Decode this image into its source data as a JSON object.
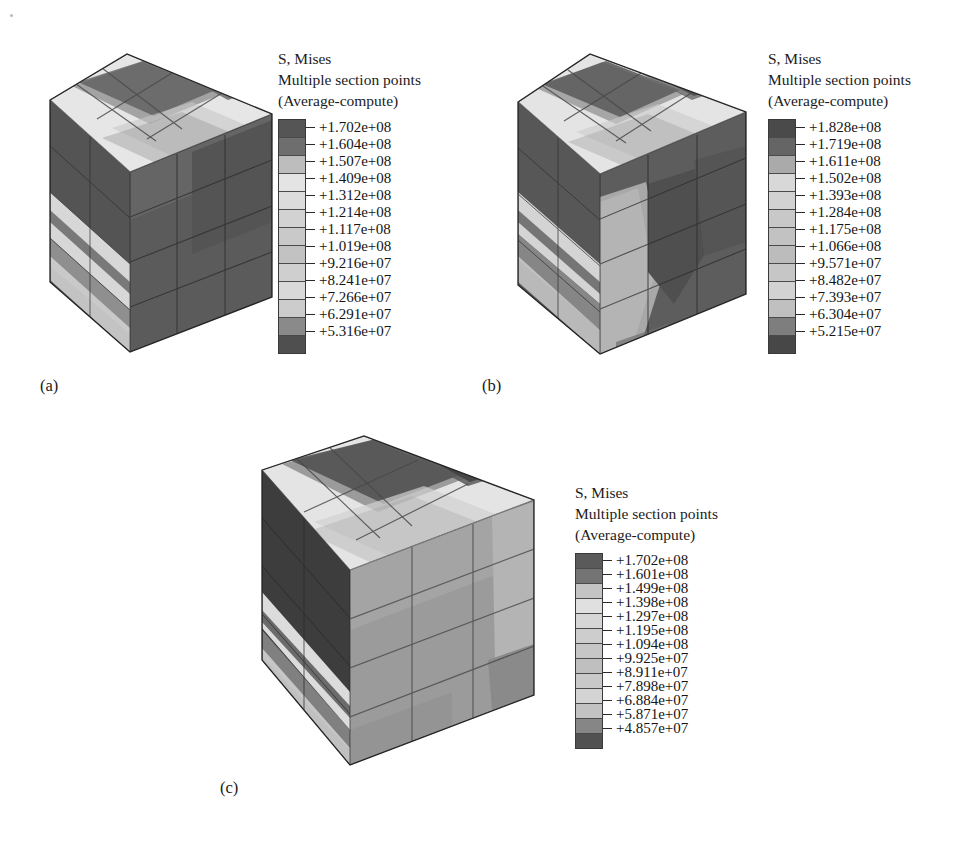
{
  "figure": {
    "background": "#ffffff",
    "panel_count": 3,
    "shared_legend_title_lines": [
      "S, Mises",
      "Multiple section points",
      "(Average-compute)"
    ]
  },
  "panels": [
    {
      "id": "a",
      "label": "(a)",
      "legend": {
        "line1": "S, Mises",
        "line2": "Multiple section points",
        "line3": "(Average-compute)",
        "values": [
          "+1.702e+08",
          "+1.604e+08",
          "+1.507e+08",
          "+1.409e+08",
          "+1.312e+08",
          "+1.214e+08",
          "+1.117e+08",
          "+1.019e+08",
          "+9.216e+07",
          "+8.241e+07",
          "+7.266e+07",
          "+6.291e+07",
          "+5.316e+07"
        ],
        "swatch_colors": [
          "#555555",
          "#6e6e6e",
          "#bdbdbd",
          "#e4e4e4",
          "#dcdcdc",
          "#d2d2d2",
          "#c9c9c9",
          "#c2c2c2",
          "#cfcfcf",
          "#d9d9d9",
          "#cccccc",
          "#8a8a8a",
          "#4f4f4f"
        ]
      },
      "cube": {
        "min_value": "+5.316e+07",
        "max_value": "+1.702e+08",
        "front_face_tone": "#5c5c5c",
        "top_face_tone": "#dcdcdc",
        "side_face_tone": "#565656",
        "grid_rows": 4,
        "grid_cols": 3
      }
    },
    {
      "id": "b",
      "label": "(b)",
      "legend": {
        "line1": "S, Mises",
        "line2": "Multiple section points",
        "line3": "(Average-compute)",
        "values": [
          "+1.828e+08",
          "+1.719e+08",
          "+1.611e+08",
          "+1.502e+08",
          "+1.393e+08",
          "+1.284e+08",
          "+1.175e+08",
          "+1.066e+08",
          "+9.571e+07",
          "+8.482e+07",
          "+7.393e+07",
          "+6.304e+07",
          "+5.215e+07"
        ],
        "swatch_colors": [
          "#4a4a4a",
          "#656565",
          "#aaaaaa",
          "#d8d8d8",
          "#d2d2d2",
          "#c8c8c8",
          "#c2c2c2",
          "#bcbcbc",
          "#c6c6c6",
          "#d2d2d2",
          "#c0c0c0",
          "#7e7e7e",
          "#474747"
        ]
      },
      "cube": {
        "min_value": "+5.215e+07",
        "max_value": "+1.828e+08",
        "front_face_tone": "#606060",
        "top_face_tone": "#d6d6d6",
        "side_face_tone": "#565656",
        "grid_rows": 4,
        "grid_cols": 3
      }
    },
    {
      "id": "c",
      "label": "(c)",
      "legend": {
        "line1": "S, Mises",
        "line2": "Multiple section points",
        "line3": "(Average-compute)",
        "values": [
          "+1.702e+08",
          "+1.601e+08",
          "+1.499e+08",
          "+1.398e+08",
          "+1.297e+08",
          "+1.195e+08",
          "+1.094e+08",
          "+9.925e+07",
          "+8.911e+07",
          "+7.898e+07",
          "+6.884e+07",
          "+5.871e+07",
          "+4.857e+07"
        ],
        "swatch_colors": [
          "#5a5a5a",
          "#747474",
          "#c4c4c4",
          "#e0e0e0",
          "#d6d6d6",
          "#cdcdcd",
          "#c6c6c6",
          "#bfbfbf",
          "#c9c9c9",
          "#d4d4d4",
          "#c2c2c2",
          "#868686",
          "#515151"
        ]
      },
      "cube": {
        "min_value": "+4.857e+07",
        "max_value": "+1.702e+08",
        "front_face_tone": "#9a9a9a",
        "top_face_tone": "#d8d8d8",
        "side_face_tone": "#4e4e4e",
        "grid_rows": 4,
        "grid_cols": 3
      }
    }
  ]
}
